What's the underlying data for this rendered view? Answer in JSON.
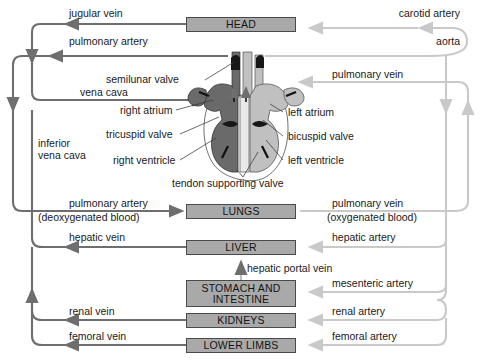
{
  "diagram": {
    "colors": {
      "vein": "#6e6e6e",
      "artery": "#c9c9c9",
      "organ_fill": "#a9a9a9",
      "organ_border": "#4a4a4a",
      "heart_right": "#6a6a6a",
      "heart_left": "#c0c0c0",
      "text": "#1a1a1a"
    }
  },
  "organs": [
    {
      "id": "head",
      "label": "HEAD"
    },
    {
      "id": "lungs",
      "label": "LUNGS"
    },
    {
      "id": "liver",
      "label": "LIVER"
    },
    {
      "id": "stomach",
      "label": "STOMACH AND",
      "label2": "INTESTINE"
    },
    {
      "id": "kidneys",
      "label": "KIDNEYS"
    },
    {
      "id": "limbs",
      "label": "LOWER LIMBS"
    }
  ],
  "vessels": {
    "jugular_vein": "jugular vein",
    "carotid_artery": "carotid artery",
    "pulmonary_artery_top": "pulmonary artery",
    "aorta": "aorta",
    "pulmonary_vein_top": "pulmonary vein",
    "vena_cava": "vena cava",
    "inferior_vena_cava_1": "inferior",
    "inferior_vena_cava_2": "vena cava",
    "pulmonary_artery_lungs": "pulmonary artery",
    "deoxygenated": "(deoxygenated blood)",
    "pulmonary_vein_lungs": "pulmonary vein",
    "oxygenated": "(oxygenated blood)",
    "hepatic_vein": "hepatic vein",
    "hepatic_artery": "hepatic artery",
    "hepatic_portal_vein": "hepatic portal vein",
    "mesenteric_artery": "mesenteric artery",
    "renal_vein": "renal vein",
    "renal_artery": "renal artery",
    "femoral_vein": "femoral vein",
    "femoral_artery": "femoral artery"
  },
  "heart_parts": {
    "semilunar_valve": "semilunar valve",
    "right_atrium": "right atrium",
    "left_atrium": "left atrium",
    "tricuspid_valve": "tricuspid valve",
    "bicuspid_valve": "bicuspid valve",
    "right_ventricle": "right ventricle",
    "left_ventricle": "left ventricle",
    "tendon_supporting_valve": "tendon supporting valve"
  }
}
